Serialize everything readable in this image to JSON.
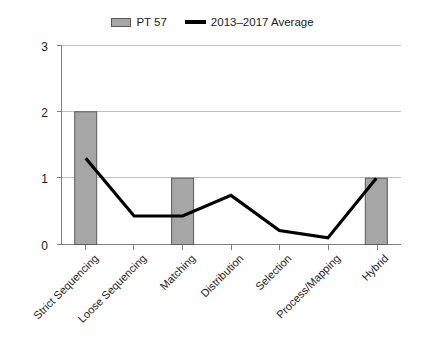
{
  "legend": {
    "position": "top-center",
    "entries": [
      {
        "label": "PT 57",
        "type": "bar",
        "color": "#a6a6a6"
      },
      {
        "label": "2013–2017 Average",
        "type": "line",
        "color": "#000000"
      }
    ]
  },
  "axis": {
    "y_ticks": [
      "0",
      "1",
      "2",
      "3"
    ],
    "x_labels": [
      "Strict Sequencing",
      "Loose Sequencing",
      "Matching",
      "Distribution",
      "Selection",
      "Process/Mapping",
      "Hybrid"
    ]
  },
  "chart_data": {
    "type": "bar",
    "title": "",
    "subtitle": "",
    "xlabel": "",
    "ylabel": "",
    "ylim": [
      0,
      3
    ],
    "yticks": [
      0,
      1,
      2,
      3
    ],
    "grid": true,
    "legend_position": "top-center",
    "categories": [
      "Strict Sequencing",
      "Loose Sequencing",
      "Matching",
      "Distribution",
      "Selection",
      "Process/Mapping",
      "Hybrid"
    ],
    "series": [
      {
        "name": "PT 57",
        "type": "bar",
        "color": "#a6a6a6",
        "values": [
          2,
          0,
          1,
          0,
          0,
          0,
          1
        ]
      },
      {
        "name": "2013–2017 Average",
        "type": "line",
        "color": "#000000",
        "values": [
          1.3,
          0.43,
          0.43,
          0.74,
          0.21,
          0.1,
          1.0
        ]
      }
    ]
  }
}
